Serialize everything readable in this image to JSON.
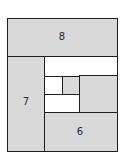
{
  "diagram": {
    "type": "nested-rectangle-partition",
    "colors": {
      "fill": "#d9d9d9",
      "empty": "#ffffff",
      "stroke": "#1e1e1e"
    },
    "regions": [
      {
        "id": "region-8",
        "label": "8",
        "fill": "gray"
      },
      {
        "id": "region-7",
        "label": "7",
        "fill": "gray"
      },
      {
        "id": "region-6",
        "label": "6",
        "fill": "gray"
      },
      {
        "id": "region-top-strip",
        "label": "",
        "fill": "white"
      },
      {
        "id": "region-right-inner",
        "label": "",
        "fill": "gray"
      },
      {
        "id": "region-small-gray",
        "label": "",
        "fill": "gray"
      },
      {
        "id": "region-small-white-left",
        "label": "",
        "fill": "white"
      },
      {
        "id": "region-small-white-bottom",
        "label": "",
        "fill": "white"
      }
    ]
  }
}
